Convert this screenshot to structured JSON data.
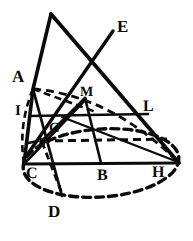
{
  "figure": {
    "style": "engraving",
    "ink_color": "#0a0a0a",
    "background_color": "#ffffff",
    "width": 193,
    "height": 241,
    "labels": [
      {
        "id": "label-A",
        "text": "A",
        "x": 12,
        "y": 68,
        "size": 17
      },
      {
        "id": "label-E",
        "text": "E",
        "x": 117,
        "y": 18,
        "size": 17
      },
      {
        "id": "label-M",
        "text": "M",
        "x": 80,
        "y": 86,
        "size": 14
      },
      {
        "id": "label-L",
        "text": "L",
        "x": 143,
        "y": 99,
        "size": 16
      },
      {
        "id": "label-I",
        "text": "I",
        "x": 15,
        "y": 104,
        "size": 15
      },
      {
        "id": "label-G",
        "text": "G",
        "x": 49,
        "y": 122,
        "size": 14
      },
      {
        "id": "label-F",
        "text": "F",
        "x": 38,
        "y": 137,
        "size": 14
      },
      {
        "id": "label-C",
        "text": "C",
        "x": 26,
        "y": 166,
        "size": 16
      },
      {
        "id": "label-B",
        "text": "B",
        "x": 97,
        "y": 168,
        "size": 16
      },
      {
        "id": "label-H",
        "text": "H",
        "x": 152,
        "y": 165,
        "size": 16
      },
      {
        "id": "label-D",
        "text": "D",
        "x": 48,
        "y": 203,
        "size": 17
      }
    ],
    "points": {
      "apex": {
        "x": 51,
        "y": 14
      },
      "A": {
        "x": 32,
        "y": 88
      },
      "E_end": {
        "x": 113,
        "y": 31
      },
      "I": {
        "x": 29,
        "y": 115
      },
      "L": {
        "x": 148,
        "y": 115
      },
      "F": {
        "x": 42,
        "y": 141
      },
      "G": {
        "x": 62,
        "y": 116
      },
      "M": {
        "x": 83,
        "y": 99
      },
      "C": {
        "x": 24,
        "y": 163
      },
      "B": {
        "x": 100,
        "y": 163
      },
      "H": {
        "x": 178,
        "y": 163
      },
      "D": {
        "x": 61,
        "y": 196
      },
      "ellipse_center": {
        "x": 101,
        "y": 163
      }
    },
    "segments": [
      {
        "id": "seg-apex-A-C",
        "name": "left-cone-edge",
        "style": "solid",
        "from": "apex",
        "to": "C"
      },
      {
        "id": "seg-apex-H",
        "name": "right-cone-edge",
        "style": "solid",
        "from": "apex",
        "to": "H"
      },
      {
        "id": "seg-E-line",
        "name": "line-to-E",
        "style": "solid",
        "from": "C",
        "to": "E_end"
      },
      {
        "id": "seg-I-L",
        "name": "chord-I-L",
        "style": "solid",
        "from": "I",
        "to": "L"
      },
      {
        "id": "seg-C-H",
        "name": "chord-C-H",
        "style": "solid",
        "from": "C",
        "to": "H"
      },
      {
        "id": "seg-F-dashed",
        "name": "chord-F-dashed",
        "style": "dashed",
        "from": "F",
        "to": "H"
      },
      {
        "id": "seg-A-M-dashed",
        "name": "chord-A-M-dashed",
        "style": "dashed",
        "from": "A",
        "to": "M"
      },
      {
        "id": "seg-M-F",
        "name": "segment-M-F",
        "style": "solid",
        "from": "M",
        "to": "F"
      },
      {
        "id": "seg-M-B",
        "name": "segment-M-B",
        "style": "solid",
        "from": "M",
        "to": "B"
      },
      {
        "id": "seg-A-D",
        "name": "segment-A-D",
        "style": "solid",
        "from": "A",
        "to": "D"
      },
      {
        "id": "seg-C-G-B",
        "name": "segment-C-to-B",
        "style": "solid",
        "from": "C",
        "to": "B"
      },
      {
        "id": "seg-F-D-dashed",
        "name": "segment-F-D-dashed",
        "style": "dashed",
        "from": "F",
        "to": "D"
      }
    ],
    "ellipse": {
      "id": "base-ellipse",
      "name": "cone-base-ellipse",
      "cx": 101,
      "cy": 163,
      "rx": 78,
      "ry": 34,
      "rotation": -4,
      "style": "dashed"
    }
  }
}
